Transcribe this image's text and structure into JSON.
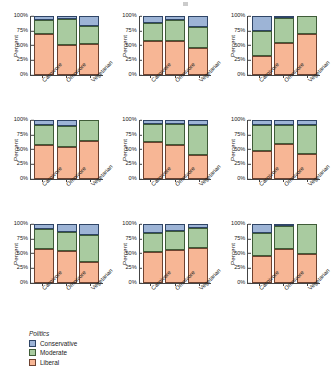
{
  "figure": {
    "axis": {
      "ylabel": "Percent",
      "yticks": [
        "100%",
        "75%",
        "50%",
        "25%",
        "0%"
      ],
      "ylim": [
        0,
        100
      ],
      "categories": [
        "Carnivore",
        "Omnivore",
        "Vegetarian"
      ]
    },
    "legend": {
      "title": "Politics",
      "entries": [
        {
          "label": "Conservative",
          "color": "#9db4d6"
        },
        {
          "label": "Moderate",
          "color": "#a9cba0"
        },
        {
          "label": "Liberal",
          "color": "#f7b695"
        }
      ]
    }
  },
  "chart_data": {
    "type": "bar",
    "title": "",
    "xlabel": "",
    "ylabel": "Percent",
    "ylim": [
      0,
      100
    ],
    "grid": false,
    "stacked": true,
    "normalized": true,
    "legend_position": "bottom-left",
    "legend_title": "Politics",
    "categories": [
      "Carnivore",
      "Omnivore",
      "Vegetarian"
    ],
    "series_names": [
      "Liberal",
      "Moderate",
      "Conservative"
    ],
    "series_colors": [
      "#f7b695",
      "#a9cba0",
      "#9db4d6"
    ],
    "panel_layout": {
      "rows": 3,
      "cols": 3
    },
    "panels": [
      {
        "index": 1,
        "row": 1,
        "col": 1,
        "bars": [
          {
            "category": "Carnivore",
            "Liberal": 70,
            "Moderate": 23,
            "Conservative": 7
          },
          {
            "category": "Omnivore",
            "Liberal": 51,
            "Moderate": 44,
            "Conservative": 5
          },
          {
            "category": "Vegetarian",
            "Liberal": 52,
            "Moderate": 31,
            "Conservative": 17
          }
        ]
      },
      {
        "index": 2,
        "row": 1,
        "col": 2,
        "bars": [
          {
            "category": "Carnivore",
            "Liberal": 58,
            "Moderate": 30,
            "Conservative": 12
          },
          {
            "category": "Omnivore",
            "Liberal": 57,
            "Moderate": 37,
            "Conservative": 6
          },
          {
            "category": "Vegetarian",
            "Liberal": 45,
            "Moderate": 36,
            "Conservative": 19
          }
        ]
      },
      {
        "index": 3,
        "row": 1,
        "col": 3,
        "bars": [
          {
            "category": "Carnivore",
            "Liberal": 33,
            "Moderate": 42,
            "Conservative": 25
          },
          {
            "category": "Omnivore",
            "Liberal": 55,
            "Moderate": 41,
            "Conservative": 4
          },
          {
            "category": "Vegetarian",
            "Liberal": 70,
            "Moderate": 30,
            "Conservative": 0
          }
        ]
      },
      {
        "index": 4,
        "row": 2,
        "col": 1,
        "bars": [
          {
            "category": "Carnivore",
            "Liberal": 58,
            "Moderate": 33,
            "Conservative": 9
          },
          {
            "category": "Omnivore",
            "Liberal": 55,
            "Moderate": 34,
            "Conservative": 11
          },
          {
            "category": "Vegetarian",
            "Liberal": 65,
            "Moderate": 35,
            "Conservative": 0
          }
        ]
      },
      {
        "index": 5,
        "row": 2,
        "col": 2,
        "bars": [
          {
            "category": "Carnivore",
            "Liberal": 63,
            "Moderate": 30,
            "Conservative": 7
          },
          {
            "category": "Omnivore",
            "Liberal": 57,
            "Moderate": 36,
            "Conservative": 7
          },
          {
            "category": "Vegetarian",
            "Liberal": 41,
            "Moderate": 51,
            "Conservative": 8
          }
        ]
      },
      {
        "index": 6,
        "row": 2,
        "col": 3,
        "bars": [
          {
            "category": "Carnivore",
            "Liberal": 48,
            "Moderate": 44,
            "Conservative": 8
          },
          {
            "category": "Omnivore",
            "Liberal": 59,
            "Moderate": 32,
            "Conservative": 9
          },
          {
            "category": "Vegetarian",
            "Liberal": 43,
            "Moderate": 48,
            "Conservative": 9
          }
        ]
      },
      {
        "index": 7,
        "row": 3,
        "col": 1,
        "bars": [
          {
            "category": "Carnivore",
            "Liberal": 58,
            "Moderate": 34,
            "Conservative": 8
          },
          {
            "category": "Omnivore",
            "Liberal": 55,
            "Moderate": 32,
            "Conservative": 13
          },
          {
            "category": "Vegetarian",
            "Liberal": 35,
            "Moderate": 47,
            "Conservative": 18
          }
        ]
      },
      {
        "index": 8,
        "row": 3,
        "col": 2,
        "bars": [
          {
            "category": "Carnivore",
            "Liberal": 52,
            "Moderate": 33,
            "Conservative": 15
          },
          {
            "category": "Omnivore",
            "Liberal": 56,
            "Moderate": 32,
            "Conservative": 12
          },
          {
            "category": "Vegetarian",
            "Liberal": 60,
            "Moderate": 34,
            "Conservative": 6
          }
        ]
      },
      {
        "index": 9,
        "row": 3,
        "col": 3,
        "bars": [
          {
            "category": "Carnivore",
            "Liberal": 45,
            "Moderate": 39,
            "Conservative": 16
          },
          {
            "category": "Omnivore",
            "Liberal": 57,
            "Moderate": 39,
            "Conservative": 4
          },
          {
            "category": "Vegetarian",
            "Liberal": 50,
            "Moderate": 50,
            "Conservative": 0
          }
        ]
      }
    ]
  }
}
